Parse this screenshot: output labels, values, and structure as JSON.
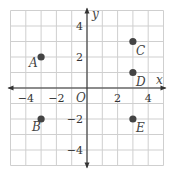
{
  "chart_data": {
    "type": "scatter",
    "title": "",
    "xlabel": "x",
    "ylabel": "y",
    "origin_label": "O",
    "xlim": [
      -5,
      5
    ],
    "ylim": [
      -5,
      5
    ],
    "grid": true,
    "x_ticks": [
      {
        "value": -4,
        "label": "−4"
      },
      {
        "value": -2,
        "label": "−2"
      },
      {
        "value": 2,
        "label": "2"
      },
      {
        "value": 4,
        "label": "4"
      }
    ],
    "y_ticks": [
      {
        "value": 4,
        "label": "4"
      },
      {
        "value": 2,
        "label": "2"
      },
      {
        "value": -2,
        "label": "−2"
      },
      {
        "value": -4,
        "label": "−4"
      }
    ],
    "points": [
      {
        "label": "A",
        "x": -3,
        "y": 2
      },
      {
        "label": "B",
        "x": -3,
        "y": -2
      },
      {
        "label": "C",
        "x": 3,
        "y": 3
      },
      {
        "label": "D",
        "x": 3,
        "y": 1
      },
      {
        "label": "E",
        "x": 3,
        "y": -2
      }
    ]
  },
  "colors": {
    "grid": "#cfcfcf",
    "axis": "#333333",
    "point": "#444444",
    "text": "#444444"
  }
}
